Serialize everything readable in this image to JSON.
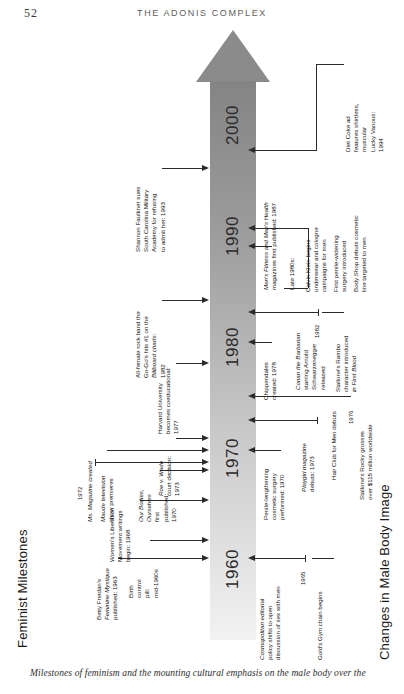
{
  "page": {
    "folio": "52",
    "running_head": "THE ADONIS COMPLEX",
    "caption": "Milestones of feminism and the mounting cultural emphasis on the male body over the"
  },
  "axes": {
    "left_title": "Feminist Milestones",
    "right_title": "Changes in Male Body Image"
  },
  "timeline": {
    "orientation": "vertical-up",
    "decades": [
      "1960",
      "1970",
      "1980",
      "1990",
      "2000"
    ],
    "gradient_from": "#f2f2f2",
    "gradient_to": "#848484"
  },
  "feminist_milestones": [
    {
      "id": "betty-friedan",
      "text": "Betty Friedan's",
      "text2": "Feminine Mystique",
      "text3": "published: 1963",
      "year": "1963"
    },
    {
      "id": "birth-control-pill",
      "text": "Birth",
      "text2": "control",
      "text3": "pill:",
      "text4": "mid-1960s",
      "year": "mid-1960s"
    },
    {
      "id": "womens-liberation",
      "text": "Women's Liberation",
      "text2": "Movement writings",
      "text3": "begin: 1968",
      "year": "1968"
    },
    {
      "id": "ms-magazine",
      "text": "Ms. Magazine created",
      "year": "1972"
    },
    {
      "id": "maude",
      "text": "Maude television",
      "text2": "show premieres",
      "year": "1972"
    },
    {
      "id": "our-bodies-ourselves",
      "text": "Our Bodies,",
      "text2": "Ourselves",
      "text3": "first",
      "text4": "published:",
      "text5": "1970",
      "year": "1970"
    },
    {
      "id": "roe-v-wade",
      "text": "Roe v. Wade",
      "text2": "court decision:",
      "text3": "1973",
      "year": "1973"
    },
    {
      "id": "harvard-coeducational",
      "text": "Harvard University",
      "text2": "becomes coeducational:",
      "text3": "1977",
      "year": "1977"
    },
    {
      "id": "go-gos",
      "text": "All-female rock band the",
      "text2": "Go-Go's hits #1 on the",
      "text3": "Billboard charts:",
      "text4": "1982",
      "year": "1982"
    },
    {
      "id": "shannon-faulkner",
      "text": "Shannon Faulkner sues",
      "text2": "South Carolina Military",
      "text3": "Academy for refusing",
      "text4": "to admit her: 1993",
      "year": "1993"
    }
  ],
  "male_body_image": [
    {
      "id": "cosmopolitan",
      "text": "Cosmopolitan editorial",
      "text2": "policy shifts to open",
      "text3": "discussion of sex with men",
      "year": "1965"
    },
    {
      "id": "golds-gym",
      "text": "Gold's Gym chain begins",
      "year": "1965"
    },
    {
      "id": "penile-lengthening",
      "text": "Penile-lengthening",
      "text2": "cosmetic surgery",
      "text3": "performed: 1970",
      "year": "1970"
    },
    {
      "id": "playgirl",
      "text": "Playgirl magazine",
      "text2": "debuts: 1973",
      "year": "1973"
    },
    {
      "id": "hair-club-for-men",
      "text": "Hair Club for Men debuts",
      "year": "1976"
    },
    {
      "id": "rocky",
      "text": "Stallone's Rocky grosses",
      "text2": "over $115 million worldwide",
      "year": "1976"
    },
    {
      "id": "chippendales",
      "text": "Chippendales",
      "text2": "created: 1978",
      "year": "1978"
    },
    {
      "id": "conan",
      "text": "Conan the Barbarian",
      "text2": "starring Arnold",
      "text3": "Schwarzenegger",
      "text4": "released",
      "year": "1982"
    },
    {
      "id": "rambo",
      "text": "Stallone's Rambo",
      "text2": "character introduced",
      "text3": "in First Blood",
      "year": "1982"
    },
    {
      "id": "mens-fitness-health",
      "text": "Men's Fitness and Men's Health",
      "text2": "magazines first published: 1987",
      "year": "1987"
    },
    {
      "id": "diet-coke",
      "text": "Diet Coke ad",
      "text2": "features shirtless,",
      "text3": "muscular",
      "text4": "Lucky Vanous:",
      "text5": "1994",
      "year": "1994"
    }
  ],
  "late_1980s_group": {
    "heading": "Late 1980s:",
    "items": [
      {
        "id": "calvin-klein",
        "text": "Calvin Klein begins",
        "text2": "underwear and cologne",
        "text3": "campaigns for men"
      },
      {
        "id": "penile-widening",
        "text": "First penile-widening",
        "text2": "surgery introduced"
      },
      {
        "id": "body-shop",
        "text": "Body Shop debuts cosmetic",
        "text2": "line targeted to men"
      }
    ]
  }
}
